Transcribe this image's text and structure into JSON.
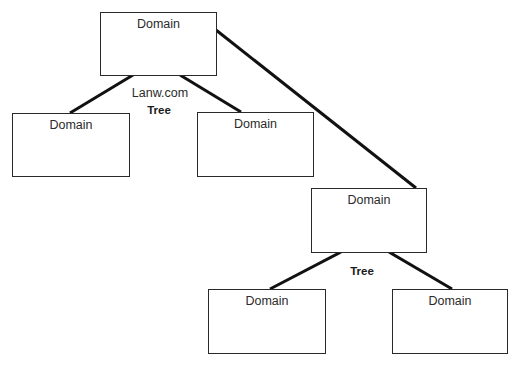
{
  "diagram": {
    "type": "domain-tree",
    "trees": [
      {
        "label": "Tree",
        "domain_name": "Lanw.com",
        "root": {
          "label": "Domain"
        },
        "children": [
          {
            "label": "Domain"
          },
          {
            "label": "Domain"
          }
        ]
      },
      {
        "label": "Tree",
        "root": {
          "label": "Domain"
        },
        "children": [
          {
            "label": "Domain"
          },
          {
            "label": "Domain"
          }
        ]
      }
    ],
    "line_color": "#111111",
    "box_border_color": "#2a2a2a"
  }
}
